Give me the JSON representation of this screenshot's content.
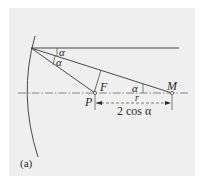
{
  "figure": {
    "panel_label": "(a)",
    "points": {
      "focus_label": "F",
      "pole_label": "P",
      "center_label": "M"
    },
    "angles": {
      "upper_angle": "α",
      "lower_angle": "α",
      "axis_angle": "α"
    },
    "dimension": {
      "top_label": "r",
      "bottom_label": "2 cos α"
    },
    "colors": {
      "background": "#efefef",
      "line": "#4a4a4a",
      "axis": "#6a6a6a"
    }
  }
}
